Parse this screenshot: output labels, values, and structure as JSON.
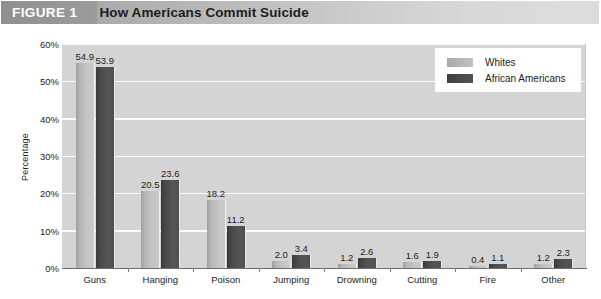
{
  "header": {
    "tag": "FIGURE 1",
    "title": "How Americans Commit Suicide"
  },
  "legend": {
    "position": "top-right",
    "entries": [
      {
        "label": "Whites",
        "color": "#c2c2c2"
      },
      {
        "label": "African Americans",
        "color": "#4b4b4b"
      }
    ]
  },
  "chart_data": {
    "type": "bar",
    "title": "How Americans Commit Suicide",
    "xlabel": "",
    "ylabel": "Percentage",
    "ylim": [
      0,
      60
    ],
    "ytick_labels": [
      "0%",
      "10%",
      "20%",
      "30%",
      "40%",
      "50%",
      "60%"
    ],
    "ytick_values": [
      0,
      10,
      20,
      30,
      40,
      50,
      60
    ],
    "grid": true,
    "categories": [
      "Guns",
      "Hanging",
      "Poison",
      "Jumping",
      "Drowning",
      "Cutting",
      "Fire",
      "Other"
    ],
    "series": [
      {
        "name": "Whites",
        "color": "#c2c2c2",
        "values": [
          54.9,
          20.5,
          18.2,
          2.0,
          1.2,
          1.6,
          0.4,
          1.2
        ],
        "labels": [
          "54.9",
          "20.5",
          "18.2",
          "2.0",
          "1.2",
          "1.6",
          "0.4",
          "1.2"
        ]
      },
      {
        "name": "African Americans",
        "color": "#4b4b4b",
        "values": [
          53.9,
          23.6,
          11.2,
          3.4,
          2.6,
          1.9,
          1.1,
          2.3
        ],
        "labels": [
          "53.9",
          "23.6",
          "11.2",
          "3.4",
          "2.6",
          "1.9",
          "1.1",
          "2.3"
        ]
      }
    ]
  }
}
